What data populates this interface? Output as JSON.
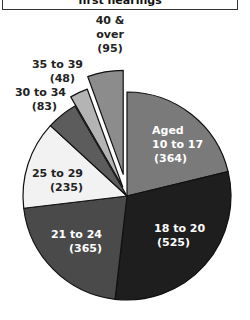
{
  "title": "first hearings",
  "chart_data": {
    "type": "pie",
    "title": "first hearings",
    "center": [
      127,
      196
    ],
    "radius": 104,
    "start_angle_deg": 0,
    "direction": "clockwise",
    "total": 1715,
    "slices": [
      {
        "label": "Aged 10 to 17",
        "value": 364,
        "color": "#7a7a7a",
        "text_color": "#ffffff",
        "exploded": false,
        "label_lines": [
          "Aged",
          "10 to 17",
          "(364)"
        ]
      },
      {
        "label": "18 to 20",
        "value": 525,
        "color": "#1e1e1e",
        "text_color": "#ffffff",
        "exploded": false,
        "label_lines": [
          "18 to 20",
          "(525)"
        ]
      },
      {
        "label": "21 to 24",
        "value": 365,
        "color": "#4a4a4a",
        "text_color": "#ffffff",
        "exploded": false,
        "label_lines": [
          "21 to 24",
          "(365)"
        ]
      },
      {
        "label": "25 to 29",
        "value": 235,
        "color": "#f2f2f2",
        "text_color": "#222222",
        "exploded": false,
        "label_lines": [
          "25 to 29",
          "(235)"
        ]
      },
      {
        "label": "30 to 34",
        "value": 83,
        "color": "#5c5c5c",
        "text_color": "#222222",
        "exploded": false,
        "label_lines": [
          "30 to 34",
          "(83)"
        ]
      },
      {
        "label": "35 to 39",
        "value": 48,
        "color": "#b4b4b4",
        "text_color": "#222222",
        "exploded": true,
        "label_lines": [
          "35 to 39",
          "(48)"
        ]
      },
      {
        "label": "40 & over",
        "value": 95,
        "color": "#8c8c8c",
        "text_color": "#222222",
        "exploded": true,
        "label_lines": [
          "40 &",
          "over",
          "(95)"
        ]
      }
    ]
  },
  "labels": {
    "aged_1": "Aged",
    "aged_2": "10 to 17",
    "aged_3": "(364)",
    "s18_1": "18 to 20",
    "s18_2": "(525)",
    "s21_1": "21 to 24",
    "s21_2": "(365)",
    "s25_1": "25 to 29",
    "s25_2": "(235)",
    "s30_1": "30 to 34",
    "s30_2": "(83)",
    "s35_1": "35 to 39",
    "s35_2": "(48)",
    "s40_1": "40 &",
    "s40_2": "over",
    "s40_3": "(95)"
  }
}
